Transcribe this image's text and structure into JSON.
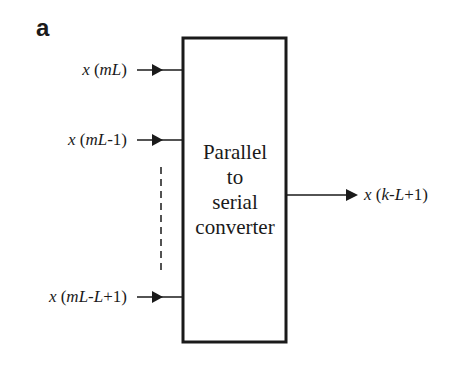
{
  "panel": {
    "label": "a"
  },
  "block": {
    "lines": [
      "Parallel",
      "to",
      "serial",
      "converter"
    ],
    "title": "Parallel to serial converter"
  },
  "inputs": [
    {
      "var": "x",
      "open": "(",
      "arg_italic": "mL",
      "arg_rest": "",
      "close": ")",
      "text": "x (mL)"
    },
    {
      "var": "x",
      "open": "(",
      "arg_italic": "mL",
      "arg_rest": "-1",
      "close": ")",
      "text": "x (mL-1)"
    },
    {
      "var": "x",
      "open": "(",
      "arg_italic": "mL",
      "arg_rest": "-",
      "arg_italic2": "L",
      "arg_rest2": "+1",
      "close": ")",
      "text": "x (mL-L+1)"
    }
  ],
  "output": {
    "var": "x",
    "open": "(",
    "arg_italic": "k",
    "arg_rest": "-",
    "arg_italic2": "L",
    "arg_rest2": "+1",
    "close": ")",
    "text": "x (k-L+1)"
  },
  "ellipsis": {
    "style": "dashed vertical line"
  },
  "colors": {
    "stroke": "#1a1a1a",
    "background": "#ffffff"
  }
}
